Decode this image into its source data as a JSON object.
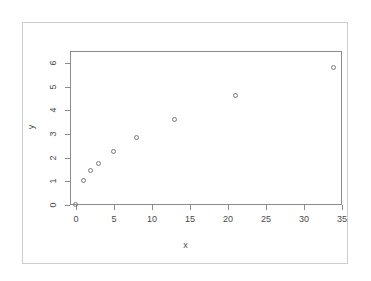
{
  "chart_data": {
    "type": "scatter",
    "title": "",
    "xlabel": "x",
    "ylabel": "y",
    "xlim": [
      -1,
      35.5
    ],
    "ylim": [
      -0.15,
      6.05
    ],
    "xticks": [
      0,
      5,
      10,
      15,
      20,
      25,
      30,
      35
    ],
    "yticks": [
      0,
      1,
      2,
      3,
      4,
      5,
      6
    ],
    "xtick_labels": [
      "0",
      "5",
      "10",
      "15",
      "20",
      "25",
      "30",
      "35"
    ],
    "ytick_labels": [
      "0",
      "1",
      "2",
      "3",
      "4",
      "5",
      "6"
    ],
    "grid": false,
    "legend": null,
    "marker": "open-circle",
    "marker_color": "#7a7a7a",
    "x": [
      0,
      1,
      2,
      3,
      5,
      8,
      13,
      21,
      34
    ],
    "y": [
      0,
      1.0,
      1.45,
      1.75,
      2.25,
      2.85,
      3.6,
      4.6,
      5.8
    ],
    "points": [
      {
        "x": 0,
        "y": 0
      },
      {
        "x": 1,
        "y": 1.0
      },
      {
        "x": 2,
        "y": 1.45
      },
      {
        "x": 3,
        "y": 1.75
      },
      {
        "x": 5,
        "y": 2.25
      },
      {
        "x": 8,
        "y": 2.85
      },
      {
        "x": 13,
        "y": 3.6
      },
      {
        "x": 21,
        "y": 4.6
      },
      {
        "x": 34,
        "y": 5.8
      }
    ],
    "n_points": 9,
    "axis_color": "#8c8c8c",
    "frame_color": "#cdcdcd",
    "background": "#ffffff"
  }
}
